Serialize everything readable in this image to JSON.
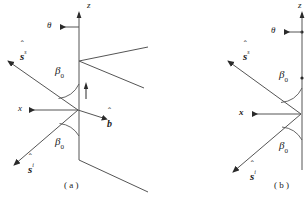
{
  "figure": {
    "type": "scattering-geometry-diagram",
    "caption_a": "( a )",
    "caption_b": "( b )",
    "line_color": "#4d4d4d",
    "text_color": "#1a1a1a",
    "background": "#ffffff"
  },
  "panel_a": {
    "axis_z_label": "z",
    "angle_theta_label": "θ",
    "angle_beta_upper_label": "β",
    "angle_beta_upper_sub": "0",
    "angle_beta_lower_label": "β",
    "angle_beta_lower_sub": "0",
    "vector_scattered_label": "s",
    "vector_scattered_hat": "ˆ",
    "vector_scattered_sup": "s",
    "vector_incident_label": "s",
    "vector_incident_hat": "ˆ",
    "vector_incident_sup": "i",
    "axis_x_label": "x",
    "vector_b_label": "b",
    "vector_b_hat": "ˆ"
  },
  "panel_b": {
    "axis_z_label": "z",
    "angle_theta_label": "θ",
    "angle_beta_upper_label": "β",
    "angle_beta_upper_sub": "0",
    "angle_beta_lower_label": "β",
    "angle_beta_lower_sub": "0",
    "vector_scattered_label": "s",
    "vector_scattered_hat": "ˆ",
    "vector_scattered_sup": "s",
    "vector_incident_label": "s",
    "vector_incident_hat": "ˆ",
    "vector_incident_sup": "i",
    "axis_x_label": "x"
  }
}
